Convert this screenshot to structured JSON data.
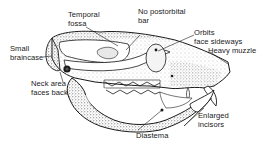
{
  "diagram": {
    "labels": {
      "temporal_fossa": "Temporal\nfossa",
      "no_postorbital_bar": "No postorbital\nbar",
      "orbits_face_sideways": "Orbits\nface sideways",
      "heavy_muzzle": "Heavy muzzle",
      "small_braincase": "Small\nbraincase",
      "neck_area_faces_back": "Neck area\nfaces back",
      "enlarged_incisors": "Enlarged\nincisors",
      "diastema": "Diastema"
    },
    "colors": {
      "ink": "#1a1a1a",
      "background": "#ffffff",
      "stipple": "#555555"
    }
  }
}
